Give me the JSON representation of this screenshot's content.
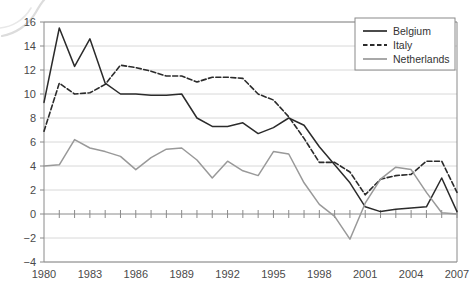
{
  "chart_data": {
    "type": "line",
    "title": "",
    "subtitle": "",
    "xlabel": "",
    "ylabel": "",
    "xlim": [
      1980,
      2007
    ],
    "ylim": [
      -4,
      16
    ],
    "y_ticks": [
      -4,
      -2,
      0,
      2,
      4,
      6,
      8,
      10,
      12,
      14,
      16
    ],
    "x_ticks": [
      1980,
      1983,
      1986,
      1989,
      1992,
      1995,
      1998,
      2001,
      2004,
      2007
    ],
    "x_tick_labels": [
      "1980",
      "1983",
      "1986",
      "1989",
      "1992",
      "1995",
      "1998",
      "2001",
      "2004",
      "2007"
    ],
    "y_tick_labels": [
      "−4",
      "−2",
      "0",
      "2",
      "4",
      "6",
      "8",
      "10",
      "12",
      "14",
      "16"
    ],
    "grid": true,
    "grid_axis": "y",
    "legend_position": "top-right",
    "x": [
      1980,
      1981,
      1982,
      1983,
      1984,
      1985,
      1986,
      1987,
      1988,
      1989,
      1990,
      1991,
      1992,
      1993,
      1994,
      1995,
      1996,
      1997,
      1998,
      1999,
      2000,
      2001,
      2002,
      2003,
      2004,
      2005,
      2006,
      2007
    ],
    "series": [
      {
        "name": "Belgium",
        "color": "#2b2b2b",
        "style": "solid",
        "values": [
          9.3,
          15.5,
          12.3,
          14.6,
          10.9,
          10.0,
          10.0,
          9.9,
          9.9,
          10.0,
          8.0,
          7.3,
          7.3,
          7.6,
          6.7,
          7.2,
          8.0,
          7.4,
          5.6,
          4.1,
          2.6,
          0.6,
          0.2,
          0.4,
          0.5,
          0.6,
          3.0,
          0.2
        ]
      },
      {
        "name": "Italy",
        "color": "#2b2b2b",
        "style": "dashed",
        "values": [
          6.9,
          10.9,
          10.0,
          10.1,
          10.8,
          12.4,
          12.2,
          11.9,
          11.5,
          11.5,
          11.0,
          11.4,
          11.4,
          11.3,
          10.0,
          9.5,
          8.1,
          6.3,
          4.3,
          4.3,
          3.5,
          1.6,
          2.9,
          3.2,
          3.3,
          4.4,
          4.4,
          1.8
        ]
      },
      {
        "name": "Netherlands",
        "color": "#999999",
        "style": "solid",
        "values": [
          4.0,
          4.1,
          6.2,
          5.5,
          5.2,
          4.8,
          3.7,
          4.7,
          5.4,
          5.5,
          4.5,
          3.0,
          4.4,
          3.6,
          3.2,
          5.2,
          5.0,
          2.6,
          0.8,
          -0.2,
          -2.1,
          0.9,
          2.9,
          3.9,
          3.7,
          1.8,
          0.1,
          0.0
        ]
      }
    ]
  },
  "legend": {
    "items": [
      {
        "label": "Belgium"
      },
      {
        "label": "Italy"
      },
      {
        "label": "Netherlands"
      }
    ]
  },
  "colors": {
    "dark_line": "#2b2b2b",
    "gray_line": "#999999",
    "grid": "#d8d8d8",
    "axis": "#8a8a8a",
    "text": "#4a4a4a",
    "zero_line": "#8a8a8a"
  }
}
